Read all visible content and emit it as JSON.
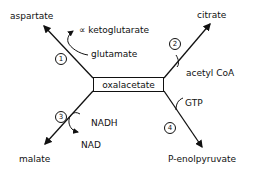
{
  "diagram": {
    "center": "oxalacetate",
    "branches": [
      {
        "step": "1",
        "product": "aspartate",
        "input": "glutamate",
        "output": "∝ ketoglutarate"
      },
      {
        "step": "2",
        "product": "citrate",
        "input": "acetyl CoA"
      },
      {
        "step": "3",
        "product": "malate",
        "input": "NADH",
        "output": "NAD"
      },
      {
        "step": "4",
        "product": "P-enolpyruvate",
        "input": "GTP"
      }
    ]
  },
  "colors": {
    "line": "#111111",
    "background": "#ffffff"
  }
}
